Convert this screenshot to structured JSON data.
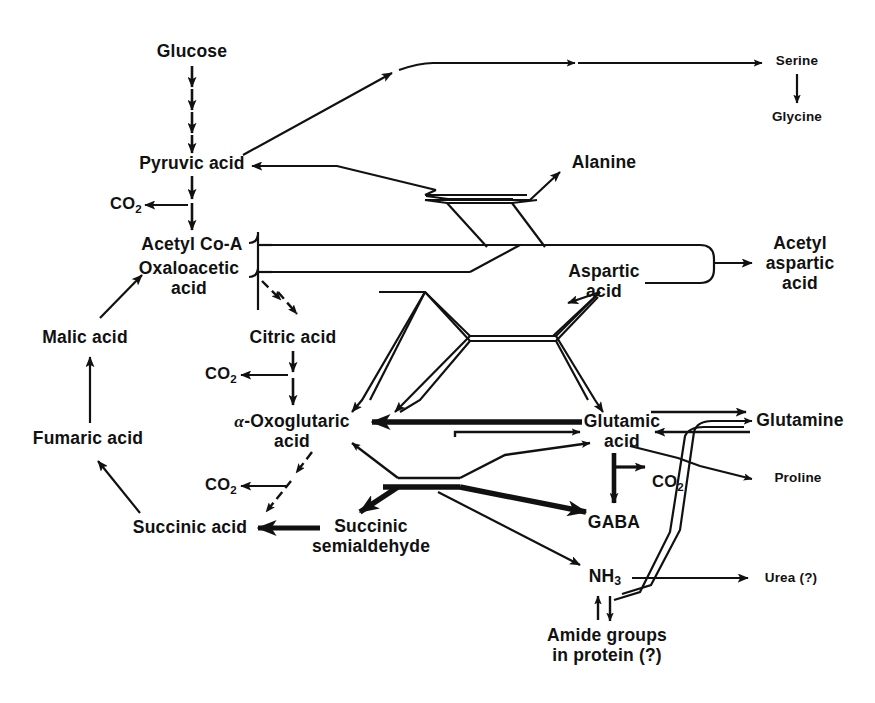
{
  "figure": {
    "kind": "metabolic-pathway-diagram",
    "background_color": "#ffffff",
    "ink_color": "#111111"
  },
  "nodes": [
    {
      "id": "glucose",
      "label": "Glucose",
      "x": 192,
      "y": 52,
      "size": "lg"
    },
    {
      "id": "pyruvic",
      "label": "Pyruvic acid",
      "x": 192,
      "y": 164,
      "size": "lg"
    },
    {
      "id": "co2-pyruvic",
      "label": "CO<sub>2</sub>",
      "x": 126,
      "y": 205,
      "size": "md",
      "html": true
    },
    {
      "id": "acetyl-coa",
      "label": "Acetyl Co-A",
      "x": 192,
      "y": 245,
      "size": "lg"
    },
    {
      "id": "oxaloacetic",
      "label": "Oxaloacetic\nacid",
      "x": 189,
      "y": 279,
      "size": "lg"
    },
    {
      "id": "malic",
      "label": "Malic acid",
      "x": 85,
      "y": 338,
      "size": "lg"
    },
    {
      "id": "fumaric",
      "label": "Fumaric acid",
      "x": 88,
      "y": 439,
      "size": "lg"
    },
    {
      "id": "succinic",
      "label": "Succinic acid",
      "x": 190,
      "y": 528,
      "size": "lg"
    },
    {
      "id": "citric",
      "label": "Citric acid",
      "x": 293,
      "y": 338,
      "size": "lg"
    },
    {
      "id": "co2-citric",
      "label": "CO<sub>2</sub>",
      "x": 221,
      "y": 375,
      "size": "md",
      "html": true
    },
    {
      "id": "oxoglutaric",
      "label": "α-Oxoglutaric\nacid",
      "x": 292,
      "y": 432,
      "size": "lg",
      "alpha": true
    },
    {
      "id": "co2-oxo",
      "label": "CO<sub>2</sub>",
      "x": 221,
      "y": 486,
      "size": "md",
      "html": true
    },
    {
      "id": "succ-semi",
      "label": "Succinic\nsemialdehyde",
      "x": 371,
      "y": 537,
      "size": "lg"
    },
    {
      "id": "serine",
      "label": "Serine",
      "x": 797,
      "y": 61,
      "size": "sm"
    },
    {
      "id": "glycine",
      "label": "Glycine",
      "x": 797,
      "y": 117,
      "size": "sm"
    },
    {
      "id": "alanine",
      "label": "Alanine",
      "x": 604,
      "y": 163,
      "size": "lg"
    },
    {
      "id": "aspartic",
      "label": "Aspartic\nacid",
      "x": 604,
      "y": 282,
      "size": "lg"
    },
    {
      "id": "acetyl-aspartic",
      "label": "Acetyl\naspartic\nacid",
      "x": 800,
      "y": 264,
      "size": "lg"
    },
    {
      "id": "glutamic",
      "label": "Glutamic\nacid",
      "x": 622,
      "y": 432,
      "size": "lg"
    },
    {
      "id": "glutamine",
      "label": "Glutamine",
      "x": 800,
      "y": 421,
      "size": "lg"
    },
    {
      "id": "proline",
      "label": "Proline",
      "x": 798,
      "y": 478,
      "size": "sm"
    },
    {
      "id": "co2-glutamic",
      "label": "CO<sub>2</sub>",
      "x": 668,
      "y": 483,
      "size": "md",
      "html": true
    },
    {
      "id": "gaba",
      "label": "GABA",
      "x": 614,
      "y": 523,
      "size": "lg"
    },
    {
      "id": "nh3",
      "label": "NH<sub>3</sub>",
      "x": 605,
      "y": 578,
      "size": "lg",
      "html": true
    },
    {
      "id": "urea",
      "label": "Urea (?)",
      "x": 791,
      "y": 578,
      "size": "sm"
    },
    {
      "id": "amide",
      "label": "Amide groups\nin protein (?)",
      "x": 607,
      "y": 646,
      "size": "lg"
    }
  ],
  "edges": [
    {
      "id": "glucose-to-pyruvic",
      "from": "glucose",
      "to": "pyruvic",
      "style": "multi-step-down",
      "steps": 4
    },
    {
      "id": "pyruvic-to-co2",
      "from": "pyruvic",
      "to": "co2-pyruvic",
      "style": "plain"
    },
    {
      "id": "pyruvic-to-acetyl",
      "from": "pyruvic",
      "to": "acetyl-coa",
      "style": "multi-step-down",
      "steps": 2
    },
    {
      "id": "pyruvic-to-serine",
      "from": "pyruvic",
      "to": "serine",
      "style": "elbow"
    },
    {
      "id": "serine-to-glycine",
      "from": "serine",
      "to": "glycine",
      "style": "plain"
    },
    {
      "id": "pyruvic-from-transaminate",
      "from": "alanine-branch",
      "to": "pyruvic",
      "style": "elbow"
    },
    {
      "id": "acetyl-to-citric",
      "from": "acetyl-coa",
      "to": "citric",
      "style": "dashed"
    },
    {
      "id": "oxaloacetic-to-citric",
      "from": "oxaloacetic",
      "to": "citric",
      "style": "dashed"
    },
    {
      "id": "citric-to-co2",
      "from": "citric",
      "to": "co2-citric",
      "style": "plain"
    },
    {
      "id": "citric-to-oxoglutaric",
      "from": "citric",
      "to": "oxoglutaric",
      "style": "multi-step-down",
      "steps": 2
    },
    {
      "id": "oxoglutaric-to-co2",
      "from": "oxoglutaric",
      "to": "co2-oxo",
      "style": "plain"
    },
    {
      "id": "oxoglutaric-to-succinic",
      "from": "oxoglutaric",
      "to": "succinic",
      "style": "dashed"
    },
    {
      "id": "succinic-to-fumaric",
      "from": "succinic",
      "to": "fumaric",
      "style": "plain"
    },
    {
      "id": "fumaric-to-malic",
      "from": "fumaric",
      "to": "malic",
      "style": "plain"
    },
    {
      "id": "malic-to-oxaloacetic",
      "from": "malic",
      "to": "oxaloacetic",
      "style": "plain"
    },
    {
      "id": "transamination-alanine",
      "from": "pyruvic",
      "to": "alanine",
      "style": "transamination"
    },
    {
      "id": "transamination-aspartic",
      "from": "oxaloacetic",
      "to": "aspartic",
      "style": "transamination"
    },
    {
      "id": "acetyl-aspartic-join",
      "from": "aspartic",
      "to": "acetyl-aspartic",
      "style": "bracket-join"
    },
    {
      "id": "oxoglutaric-glutamic",
      "from": "oxoglutaric",
      "to": "glutamic",
      "style": "bold-reversible"
    },
    {
      "id": "glutamic-to-glutamine",
      "from": "glutamic",
      "to": "glutamine",
      "style": "reversible"
    },
    {
      "id": "glutamic-to-proline",
      "from": "glutamic",
      "to": "proline",
      "style": "plain"
    },
    {
      "id": "glutamic-to-co2",
      "from": "glutamic",
      "to": "co2-glutamic",
      "style": "plain"
    },
    {
      "id": "glutamic-to-gaba",
      "from": "glutamic",
      "to": "gaba",
      "style": "bold"
    },
    {
      "id": "gaba-shunt",
      "from": "gaba",
      "to": "succ-semi",
      "style": "bold-crossing"
    },
    {
      "id": "succ-semi-to-succinic",
      "from": "succ-semi",
      "to": "succinic",
      "style": "bold"
    },
    {
      "id": "glutamic-to-nh3",
      "from": "glutamic",
      "to": "nh3",
      "style": "plain"
    },
    {
      "id": "nh3-to-urea",
      "from": "nh3",
      "to": "urea",
      "style": "plain"
    },
    {
      "id": "nh3-to-amide",
      "from": "nh3",
      "to": "amide",
      "style": "reversible-vertical"
    },
    {
      "id": "nh3-to-glutamine-loop",
      "from": "nh3",
      "to": "glutamine",
      "style": "double-line"
    }
  ]
}
